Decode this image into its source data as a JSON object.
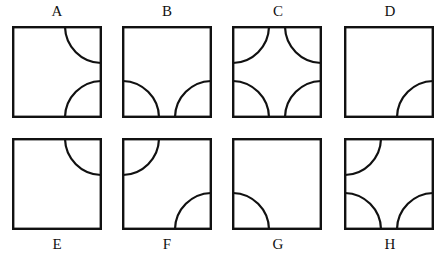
{
  "figures": [
    {
      "label": "A",
      "corners": [
        "tr",
        "br"
      ]
    },
    {
      "label": "B",
      "corners": [
        "bl",
        "br"
      ]
    },
    {
      "label": "C",
      "corners": [
        "tl",
        "tr",
        "bl",
        "br"
      ]
    },
    {
      "label": "D",
      "corners": [
        "br"
      ]
    },
    {
      "label": "E",
      "corners": [
        "tr"
      ]
    },
    {
      "label": "F",
      "corners": [
        "tl",
        "br"
      ]
    },
    {
      "label": "G",
      "corners": [
        "bl"
      ]
    },
    {
      "label": "H",
      "corners": [
        "tl",
        "bl",
        "br"
      ]
    }
  ],
  "colors": {
    "stroke": "#111111",
    "background": "#ffffff"
  }
}
